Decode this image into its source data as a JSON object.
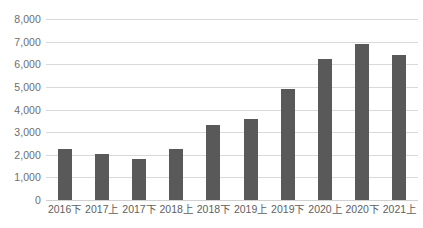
{
  "chart_data": {
    "type": "bar",
    "title": "",
    "subtitle": "",
    "xlabel": "",
    "ylabel": "",
    "categories": [
      "2016下",
      "2017上",
      "2017下",
      "2018上",
      "2018下",
      "2019上",
      "2019下",
      "2020上",
      "2020下",
      "2021上"
    ],
    "values": [
      2250,
      2050,
      1800,
      2250,
      3300,
      3600,
      4900,
      6250,
      6880,
      6420
    ],
    "series": [
      {
        "name": "",
        "values": [
          2250,
          2050,
          1800,
          2250,
          3300,
          3600,
          4900,
          6250,
          6880,
          6420
        ]
      }
    ],
    "ylim": [
      0,
      8000
    ],
    "ytick_step": 1000,
    "ytick_labels": [
      "8,000",
      "7,000",
      "6,000",
      "5,000",
      "4,000",
      "3,000",
      "2,000",
      "1,000",
      "0"
    ],
    "ytick_values": [
      8000,
      7000,
      6000,
      5000,
      4000,
      3000,
      2000,
      1000,
      0
    ],
    "grid": true,
    "grid_axis": "y",
    "legend": false,
    "legend_position": "none",
    "bar_color": "#595959",
    "grid_color": "#d9d9d9",
    "axis_label_color": "#6e6e6e",
    "background_color": "#ffffff"
  }
}
